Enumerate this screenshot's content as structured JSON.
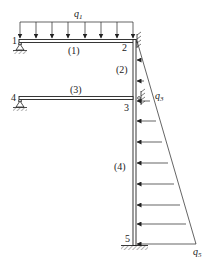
{
  "diagram": {
    "type": "structural-frame",
    "nodes": [
      {
        "id": "1",
        "label": "1"
      },
      {
        "id": "2",
        "label": "2"
      },
      {
        "id": "3",
        "label": "3"
      },
      {
        "id": "4",
        "label": "4"
      },
      {
        "id": "5",
        "label": "5"
      }
    ],
    "members": [
      {
        "id": "1",
        "label": "(1)",
        "from": "1",
        "to": "2"
      },
      {
        "id": "2",
        "label": "(2)",
        "from": "2",
        "to": "3"
      },
      {
        "id": "3",
        "label": "(3)",
        "from": "4",
        "to": "3"
      },
      {
        "id": "4",
        "label": "(4)",
        "from": "3",
        "to": "5"
      }
    ],
    "loads": {
      "q1": {
        "symbol": "q",
        "subscript": "1",
        "kind": "uniform-distributed",
        "on": "member-1"
      },
      "q3": {
        "symbol": "q",
        "subscript": "3",
        "kind": "linearly-varying",
        "on": "column"
      },
      "q5": {
        "symbol": "q",
        "subscript": "5",
        "kind": "linearly-varying",
        "on": "column"
      }
    },
    "supports": [
      {
        "node": "1",
        "kind": "pin"
      },
      {
        "node": "4",
        "kind": "pin"
      },
      {
        "node": "2",
        "kind": "roller-wall"
      },
      {
        "node": "3",
        "kind": "roller-wall"
      },
      {
        "node": "5",
        "kind": "fixed"
      }
    ],
    "colors": {
      "line": "#222222",
      "background": "#ffffff"
    }
  }
}
